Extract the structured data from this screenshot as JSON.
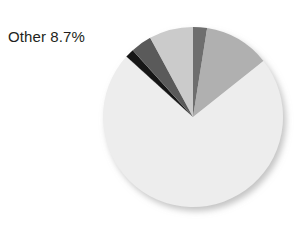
{
  "annotations": [
    {
      "name": "other-label",
      "text": "Other 8.7%",
      "x": 8,
      "y": 28
    }
  ],
  "chart_data": {
    "type": "pie",
    "title": "",
    "subtitle": "",
    "xlabel": "",
    "ylabel": "",
    "legend": "none",
    "grid": false,
    "center": {
      "cx": 193,
      "cy": 117
    },
    "radius": 90,
    "start_angle_deg": -90,
    "direction": "clockwise",
    "labels": [
      "Slice 1",
      "Slice 2",
      "Other",
      "Slice 4",
      "Slice 5",
      "Slice 6"
    ],
    "values": [
      2.2,
      10.3,
      63.3,
      1.4,
      3.3,
      6.9
    ],
    "display_labels": [
      "",
      "",
      "Other 8.7%",
      "",
      "",
      ""
    ],
    "colors": [
      "#6e6e6e",
      "#b0b0b0",
      "#ededed",
      "#141414",
      "#5a5a5a",
      "#cbcbcb"
    ],
    "annotated_slice": "Other",
    "annotated_value": "8.7%",
    "shadow": true,
    "shadow_color": "#d8d8d8"
  }
}
